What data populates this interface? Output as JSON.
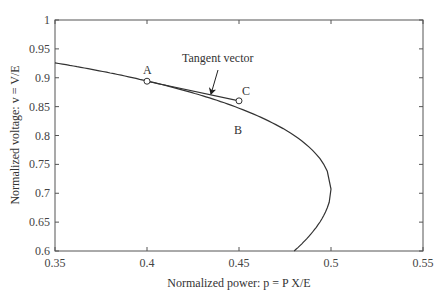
{
  "chart_data": {
    "type": "line",
    "title": "",
    "xlabel": "Normalized power: p = P X/E",
    "ylabel": "Normalized voltage: v = V/E",
    "xlim": [
      0.35,
      0.55
    ],
    "ylim": [
      0.6,
      1.0
    ],
    "grid": false,
    "legend": null,
    "x_ticks": [
      "0.35",
      "0.4",
      "0.45",
      "0.5",
      "0.55"
    ],
    "y_ticks": [
      "0.6",
      "0.65",
      "0.7",
      "0.75",
      "0.8",
      "0.85",
      "0.9",
      "0.95",
      "1"
    ],
    "series": [
      {
        "name": "PV curve",
        "x": [
          0.35,
          0.375,
          0.4,
          0.425,
          0.45,
          0.47,
          0.485,
          0.495,
          0.5,
          0.495,
          0.49,
          0.485,
          0.48
        ],
        "y": [
          0.926,
          0.912,
          0.894,
          0.873,
          0.847,
          0.818,
          0.786,
          0.751,
          0.707,
          0.663,
          0.641,
          0.621,
          0.6
        ]
      },
      {
        "name": "Tangent vector",
        "x": [
          0.4,
          0.45
        ],
        "y": [
          0.894,
          0.86
        ]
      }
    ],
    "points": [
      {
        "label": "A",
        "x": 0.4,
        "y": 0.894,
        "marker": "circle"
      },
      {
        "label": "B",
        "x": 0.45,
        "y": 0.847,
        "marker": "none"
      },
      {
        "label": "C",
        "x": 0.45,
        "y": 0.86,
        "marker": "circle"
      }
    ],
    "annotations": [
      {
        "text": "Tangent vector",
        "arrow_to": {
          "x": 0.424,
          "y": 0.872
        }
      }
    ]
  },
  "labels": {
    "A": "A",
    "B": "B",
    "C": "C",
    "tangent": "Tangent vector"
  }
}
